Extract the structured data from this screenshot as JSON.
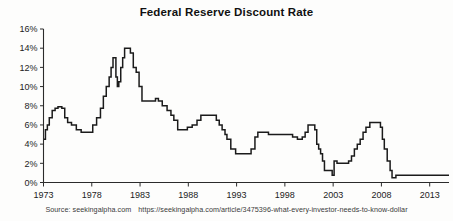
{
  "figure": {
    "title": "Federal Reserve Discount Rate",
    "source_label": "Source: seekingalpha.com",
    "source_url": "https://seekingalpha.com/article/3475396-what-every-investor-needs-to-know-dollar",
    "line_color": "#1b1b1b",
    "background_color": "#fdfdfc",
    "axis_color": "#2b2b2b"
  },
  "chart_data": {
    "type": "line",
    "title": "Federal Reserve Discount Rate",
    "xlabel": "",
    "ylabel": "",
    "xlim": [
      1973,
      2015
    ],
    "ylim": [
      0,
      16
    ],
    "grid": false,
    "legend": null,
    "ytick_labels": [
      "0%",
      "2%",
      "4%",
      "6%",
      "8%",
      "10%",
      "12%",
      "14%",
      "16%"
    ],
    "ytick_values": [
      0,
      2,
      4,
      6,
      8,
      10,
      12,
      14,
      16
    ],
    "xtick_labels": [
      "1973",
      "1978",
      "1983",
      "1988",
      "1993",
      "1998",
      "2003",
      "2008",
      "2013"
    ],
    "xtick_values": [
      1973,
      1978,
      1983,
      1988,
      1993,
      1998,
      2003,
      2008,
      2013
    ],
    "series": [
      {
        "name": "Federal Reserve Discount Rate",
        "x": [
          1973.0,
          1973.2,
          1973.4,
          1973.6,
          1973.9,
          1974.2,
          1974.5,
          1974.9,
          1975.2,
          1975.5,
          1975.9,
          1976.4,
          1976.9,
          1977.4,
          1977.8,
          1978.1,
          1978.5,
          1978.9,
          1979.2,
          1979.5,
          1979.8,
          1980.0,
          1980.2,
          1980.35,
          1980.5,
          1980.65,
          1980.8,
          1981.0,
          1981.2,
          1981.4,
          1981.7,
          1982.0,
          1982.3,
          1982.6,
          1982.9,
          1983.2,
          1983.7,
          1984.2,
          1984.6,
          1984.9,
          1985.3,
          1985.8,
          1986.2,
          1986.5,
          1986.9,
          1987.4,
          1987.9,
          1988.4,
          1988.9,
          1989.3,
          1989.9,
          1990.5,
          1990.9,
          1991.2,
          1991.5,
          1991.8,
          1992.0,
          1992.4,
          1992.9,
          1993.5,
          1994.0,
          1994.5,
          1994.9,
          1995.2,
          1995.7,
          1996.3,
          1996.9,
          1997.5,
          1998.2,
          1998.8,
          1999.3,
          1999.8,
          2000.1,
          2000.4,
          2000.9,
          2001.1,
          2001.3,
          2001.5,
          2001.7,
          2001.9,
          2002.1,
          2002.6,
          2002.9,
          2003.1,
          2003.4,
          2003.7,
          2004.2,
          2004.6,
          2004.9,
          2005.2,
          2005.5,
          2005.8,
          2006.1,
          2006.4,
          2006.8,
          2007.3,
          2007.7,
          2007.9,
          2008.1,
          2008.3,
          2008.6,
          2008.9,
          2009.1,
          2009.5,
          2010.2,
          2010.6,
          2011.2,
          2012.0,
          2013.0,
          2014.0,
          2015.0
        ],
        "y": [
          4.5,
          5.5,
          6.0,
          6.75,
          7.5,
          7.75,
          7.9,
          7.75,
          6.75,
          6.25,
          6.0,
          5.5,
          5.25,
          5.25,
          5.25,
          6.0,
          6.75,
          7.75,
          9.0,
          10.0,
          11.0,
          12.0,
          13.0,
          13.0,
          11.0,
          10.0,
          10.5,
          12.0,
          13.0,
          14.0,
          14.0,
          13.5,
          12.0,
          11.5,
          10.0,
          8.5,
          8.5,
          8.5,
          8.75,
          8.5,
          8.0,
          7.5,
          7.0,
          6.5,
          5.5,
          5.5,
          5.75,
          6.0,
          6.5,
          7.0,
          7.0,
          7.0,
          6.5,
          6.0,
          5.5,
          5.0,
          4.5,
          3.5,
          3.0,
          3.0,
          3.0,
          3.5,
          4.75,
          5.25,
          5.25,
          5.0,
          5.0,
          5.0,
          5.0,
          4.75,
          4.5,
          4.75,
          5.25,
          6.0,
          6.0,
          5.5,
          4.0,
          3.5,
          3.0,
          2.25,
          1.25,
          1.25,
          0.75,
          2.25,
          2.0,
          2.0,
          2.0,
          2.25,
          2.75,
          3.5,
          4.0,
          4.5,
          5.25,
          5.75,
          6.25,
          6.25,
          6.25,
          5.75,
          4.5,
          3.5,
          2.25,
          1.25,
          0.5,
          0.75,
          0.75,
          0.75,
          0.75,
          0.75,
          0.75,
          0.75,
          0.75
        ]
      }
    ]
  }
}
